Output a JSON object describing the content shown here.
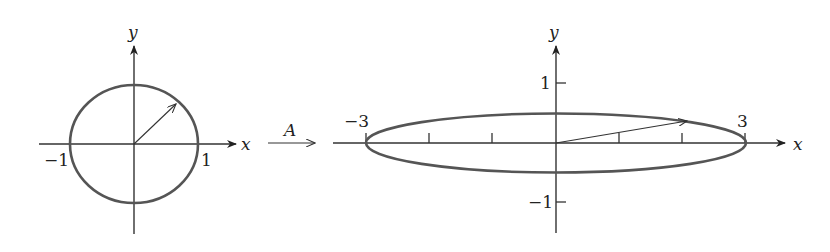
{
  "left_plot": {
    "x_axis_label": "x",
    "y_axis_label": "y",
    "tick_labels": {
      "x_neg": "−1",
      "x_pos": "1"
    },
    "shape": "unit circle",
    "vector": {
      "x": 0.707,
      "y": 0.707
    }
  },
  "transform": {
    "label": "A"
  },
  "right_plot": {
    "x_axis_label": "x",
    "y_axis_label": "y",
    "tick_labels": {
      "x_neg": "−3",
      "x_pos": "3",
      "y_pos": "1",
      "y_neg": "−1"
    },
    "shape": "ellipse",
    "semi_axes": {
      "x": 3,
      "y": 0.5
    },
    "x_ticks": [
      -3,
      -2,
      -1,
      1,
      2,
      3
    ],
    "vector": {
      "x": 2.1,
      "y": 0.35
    }
  },
  "colors": {
    "curve": "#555555",
    "axis": "#333333",
    "background": "#ffffff"
  }
}
